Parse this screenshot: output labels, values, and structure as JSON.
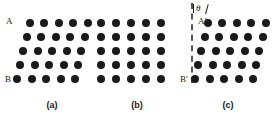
{
  "figure": {
    "background_color": "#ffffff",
    "dot_color": "#1a1a1a",
    "axis_color": "#555555",
    "dot_diameter": 8,
    "panels": [
      {
        "id": "panel-a",
        "caption": "(a)",
        "caption_x": 52,
        "caption_y": 101,
        "lattice": {
          "origin_x": 17,
          "origin_y": 79,
          "columns": 5,
          "rows": 5,
          "col_spacing": 14.5,
          "row_spacing": 14.0,
          "shear_per_row": 3.2,
          "tilt_degrees": 13
        },
        "labels": [
          {
            "name": "vertex-label-a-top",
            "text": "A",
            "x": 6,
            "y": 17
          },
          {
            "name": "vertex-label-a-bottom",
            "text": "B",
            "x": 5,
            "y": 75
          }
        ],
        "axis": null,
        "angle": null
      },
      {
        "id": "panel-b",
        "caption": "(b)",
        "caption_x": 137,
        "caption_y": 101,
        "lattice": {
          "origin_x": 101,
          "origin_y": 79,
          "columns": 5,
          "rows": 5,
          "col_spacing": 15.0,
          "row_spacing": 14.0,
          "shear_per_row": 0,
          "tilt_degrees": 0
        },
        "labels": [],
        "axis": null,
        "angle": null
      },
      {
        "id": "panel-c",
        "caption": "(c)",
        "caption_x": 228,
        "caption_y": 101,
        "lattice": {
          "origin_x": 195,
          "origin_y": 79,
          "columns": 5,
          "rows": 5,
          "col_spacing": 14.5,
          "row_spacing": 14.0,
          "shear_per_row": 3.2,
          "tilt_degrees": 13
        },
        "labels": [
          {
            "name": "vertex-label-c-top",
            "text": "A′",
            "x": 198,
            "y": 17
          },
          {
            "name": "vertex-label-c-bottom",
            "text": "B′",
            "x": 180,
            "y": 75
          }
        ],
        "axis": {
          "name": "reference-axis-dashed",
          "x": 191,
          "y_top": 3,
          "height": 80
        },
        "angle": {
          "symbol": "θ",
          "x": 193,
          "y": 4
        }
      }
    ]
  }
}
